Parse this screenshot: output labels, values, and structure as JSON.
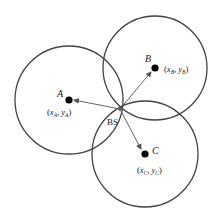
{
  "diagram": {
    "type": "trilateration",
    "colors": {
      "stroke": "#444444",
      "dot": "#000000",
      "text": "#222222",
      "background": "#ffffff"
    },
    "base_station": {
      "label": "BS",
      "x": 120,
      "y": 109
    },
    "nodes": [
      {
        "id": "A",
        "label": "A",
        "coord_label": "(x_A, y_A)",
        "coord_x": "x",
        "coord_y": "y",
        "sub": "A",
        "cx": 69,
        "cy": 100,
        "r": 54
      },
      {
        "id": "B",
        "label": "B",
        "coord_label": "(x_B, y_B)",
        "coord_x": "x",
        "coord_y": "y",
        "sub": "B",
        "cx": 155,
        "cy": 68,
        "r": 52
      },
      {
        "id": "C",
        "label": "C",
        "coord_label": "(x_C, y_C)",
        "coord_x": "x",
        "coord_y": "y",
        "sub": "C",
        "cx": 145,
        "cy": 154,
        "r": 53
      }
    ]
  }
}
